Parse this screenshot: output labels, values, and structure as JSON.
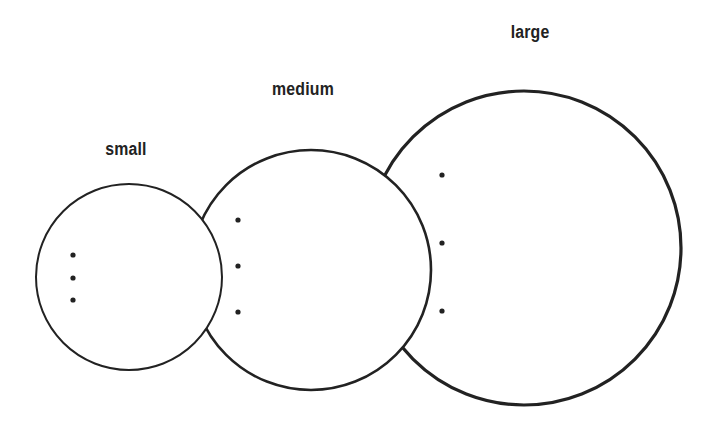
{
  "diagram": {
    "title": "",
    "stroke_color": "#222222",
    "fill_color": "#ffffff",
    "circles": [
      {
        "id": "large",
        "label": "large",
        "cx": 524,
        "cy": 248,
        "r": 157,
        "label_x": 530,
        "label_y": 22,
        "stroke_width": 3.2,
        "dots": [
          {
            "x": 442,
            "y": 175
          },
          {
            "x": 442,
            "y": 243
          },
          {
            "x": 442,
            "y": 311
          }
        ]
      },
      {
        "id": "medium",
        "label": "medium",
        "cx": 311,
        "cy": 270,
        "r": 120,
        "label_x": 303,
        "label_y": 79,
        "stroke_width": 2.6,
        "dots": [
          {
            "x": 238,
            "y": 220
          },
          {
            "x": 238,
            "y": 266
          },
          {
            "x": 238,
            "y": 312
          }
        ]
      },
      {
        "id": "small",
        "label": "small",
        "cx": 129,
        "cy": 277,
        "r": 93,
        "label_x": 126,
        "label_y": 139,
        "stroke_width": 2.0,
        "dots": [
          {
            "x": 73,
            "y": 255
          },
          {
            "x": 73,
            "y": 278
          },
          {
            "x": 73,
            "y": 300
          }
        ]
      }
    ]
  }
}
